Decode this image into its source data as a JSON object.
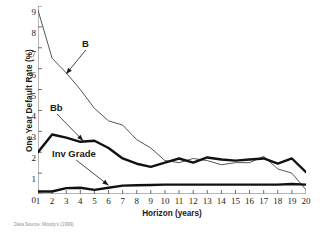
{
  "chart_data": {
    "type": "line",
    "title": "",
    "xlabel": "Horizon (years)",
    "ylabel": "One Year Default Rate (%)",
    "xlim": [
      1,
      20
    ],
    "ylim": [
      0,
      9
    ],
    "grid": false,
    "legend_position": "inline-annotations",
    "x": [
      1,
      2,
      3,
      4,
      5,
      6,
      7,
      8,
      9,
      10,
      11,
      12,
      13,
      14,
      15,
      16,
      17,
      18,
      19,
      20
    ],
    "xticklabels": [
      "1",
      "2",
      "3",
      "4",
      "5",
      "6",
      "7",
      "8",
      "9",
      "10",
      "11",
      "12",
      "13",
      "14",
      "15",
      "16",
      "17",
      "18",
      "19",
      "20"
    ],
    "yticklabels": [
      "0",
      "1",
      "2",
      "3",
      "4",
      "5",
      "6",
      "7",
      "8",
      "9"
    ],
    "series": [
      {
        "name": "B",
        "style": "thin",
        "color": "#555555",
        "values": [
          8.8,
          6.5,
          5.8,
          5.0,
          4.1,
          3.5,
          3.3,
          2.6,
          2.2,
          1.6,
          1.5,
          1.7,
          1.6,
          1.4,
          1.5,
          1.5,
          1.8,
          1.2,
          1.0,
          0.2
        ]
      },
      {
        "name": "Bb",
        "style": "thick",
        "color": "#111111",
        "values": [
          2.0,
          2.85,
          2.7,
          2.5,
          2.55,
          2.2,
          1.7,
          1.45,
          1.3,
          1.5,
          1.7,
          1.5,
          1.75,
          1.65,
          1.6,
          1.65,
          1.7,
          1.45,
          1.7,
          1.05
        ]
      },
      {
        "name": "Inv Grade",
        "style": "thick",
        "color": "#111111",
        "values": [
          0.12,
          0.12,
          0.28,
          0.3,
          0.2,
          0.3,
          0.4,
          0.42,
          0.43,
          0.45,
          0.45,
          0.45,
          0.45,
          0.45,
          0.45,
          0.45,
          0.45,
          0.45,
          0.48,
          0.45
        ]
      }
    ],
    "annotations": [
      {
        "text": "B",
        "target_x": 3.0,
        "target_y": 5.75
      },
      {
        "text": "Bb",
        "target_x": 4.2,
        "target_y": 2.55
      },
      {
        "text": "Inv Grade",
        "target_x": 6.0,
        "target_y": 0.42
      }
    ],
    "source_note": "Data Source: Moody's (1999)"
  }
}
